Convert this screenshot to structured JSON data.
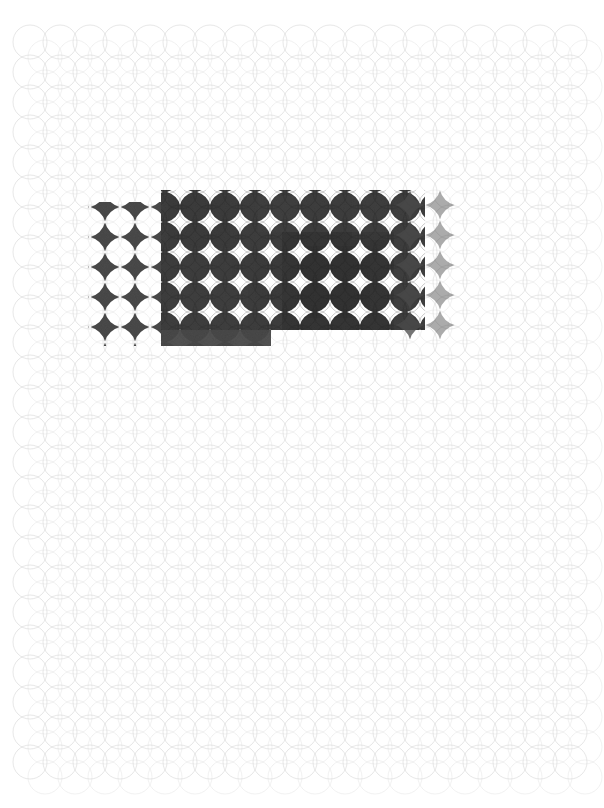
{
  "artwork": {
    "title": "Overlapping Circle Lattice with Dark Block Overlay",
    "type": "abstract-generative-pattern",
    "canvas_width": 604,
    "canvas_height": 808,
    "background_color": "#ffffff"
  },
  "palette": {
    "background": "#ffffff",
    "grid_stroke": "#c9c9c9",
    "grid_stroke_faint": "#dcdcdc",
    "block_dark": "#3f3f3f",
    "block_darkest": "#2b2b2b",
    "block_mid": "#595959",
    "diamond_left": "#4a4a4a",
    "highlight": "#ffffff"
  },
  "grid": {
    "label": "circle-lattice",
    "origin_x": 30,
    "origin_y": 42,
    "pitch_x": 30,
    "pitch_y": 30,
    "columns": 19,
    "rows": 25,
    "circle_radius": 17,
    "stroke_width": 0.6,
    "extent_right": 575,
    "extent_bottom": 782
  },
  "regions": [
    {
      "name": "left-diamond-block",
      "description": "Two-and-a-half columns of dark diamonds on white ground",
      "x": 90,
      "y": 203,
      "width": 72,
      "height": 142,
      "fill": "#4a4a4a",
      "mode": "diamonds-only"
    },
    {
      "name": "main-dark-block",
      "description": "Primary dark rectangular overlay across the lattice",
      "x": 161,
      "y": 190,
      "width": 264,
      "height": 140,
      "fill": "#3f3f3f",
      "mode": "solid-overlay"
    },
    {
      "name": "dark-block-step",
      "description": "Lower-left step protruding beneath the main block",
      "x": 161,
      "y": 330,
      "width": 110,
      "height": 16,
      "fill": "#4a4a4a",
      "mode": "solid-overlay"
    },
    {
      "name": "dense-core",
      "description": "Darkest cluster toward the right-centre of the main block",
      "x": 282,
      "y": 232,
      "width": 112,
      "height": 98,
      "fill": "#2b2b2b",
      "mode": "solid-overlay"
    },
    {
      "name": "scalloped-top-edge",
      "description": "Arched circle tops along the upper boundary of the dark block",
      "x": 161,
      "y": 182,
      "width": 264,
      "height": 14,
      "fill": "#3f3f3f",
      "mode": "arcs"
    }
  ],
  "annotations": {
    "overall": "Light gray lattice of overlapping circles filling the page, interrupted by a dark rectangular block in the upper third that reveals white star-shaped negative space at each lattice intersection.",
    "texture": "grain / toner-like mottling across the dark block",
    "visible_text": "none"
  }
}
